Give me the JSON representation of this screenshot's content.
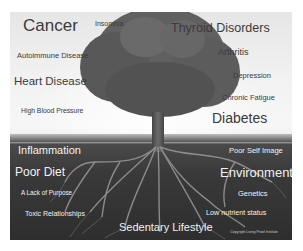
{
  "image": {
    "description": "Tree with visible roots illustrating chronic diseases (branches) and root causes (roots)",
    "colors": {
      "sky": "#f2f2f2",
      "soil": "#333333",
      "dark_text": "#3a3a3a",
      "light_text": "#f2f2f2"
    }
  },
  "above_ground": {
    "labels": [
      {
        "text": "Cancer"
      },
      {
        "text": "Insomnia"
      },
      {
        "text": "Thyroid Disorders"
      },
      {
        "text": "Autoimmune Disease"
      },
      {
        "text": "Arthritis"
      },
      {
        "text": "Heart Disease"
      },
      {
        "text": "Depression"
      },
      {
        "text": "High Blood Pressure"
      },
      {
        "text": "Chronic Fatigue"
      },
      {
        "text": "Diabetes"
      }
    ]
  },
  "below_ground": {
    "labels": [
      {
        "text": "Inflammation"
      },
      {
        "text": "Poor Self Image"
      },
      {
        "text": "Poor Diet"
      },
      {
        "text": "Environment"
      },
      {
        "text": "A Lack of Purpose"
      },
      {
        "text": "Genetics"
      },
      {
        "text": "Toxic Relationships"
      },
      {
        "text": "Low nutrient status"
      },
      {
        "text": "Sedentary Lifestyle"
      }
    ]
  },
  "copyright": "Copyright Living Proof Institute"
}
